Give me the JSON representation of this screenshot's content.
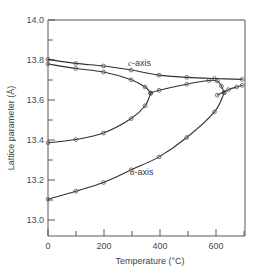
{
  "chart_data": {
    "type": "line",
    "title": "",
    "xlabel": "Temperature  (°C)",
    "ylabel": "Lattice parameter  (Å)",
    "xlim": [
      0,
      710
    ],
    "ylim": [
      12.93,
      14.0
    ],
    "grid": false,
    "legend_position": "inline-annotation",
    "x_ticks_major": [
      0,
      200,
      400,
      600
    ],
    "x_ticklabels": [
      "0",
      "200",
      "400",
      "600"
    ],
    "x_ticks_minor": [
      100,
      300,
      500,
      700
    ],
    "y_ticks_major": [
      14.0,
      13.8,
      13.6,
      13.4,
      13.2,
      13.0
    ],
    "y_ticklabels": [
      "14.0",
      "13.8",
      "13.6",
      "13.4",
      "13.2",
      "13.0"
    ],
    "y_ticks_minor": [
      13.9,
      13.7,
      13.5,
      13.3,
      13.1
    ],
    "annotations": [
      {
        "text": "c-axis",
        "italic_prefix": "c",
        "rest": "-axis",
        "x": 330,
        "y": 13.745
      },
      {
        "text": "a-axis",
        "italic_prefix": "a",
        "rest": "-axis",
        "x": 335,
        "y": 13.265
      }
    ],
    "series": [
      {
        "name": "c-axis upper branch",
        "points": [
          {
            "x": 0,
            "y": 13.805
          },
          {
            "x": 100,
            "y": 13.785
          },
          {
            "x": 200,
            "y": 13.772
          },
          {
            "x": 300,
            "y": 13.752
          },
          {
            "x": 400,
            "y": 13.727
          },
          {
            "x": 500,
            "y": 13.716
          },
          {
            "x": 600,
            "y": 13.71
          },
          {
            "x": 700,
            "y": 13.706
          }
        ]
      },
      {
        "name": "c-axis lower branch (splitting, merges at ~370 C)",
        "points": [
          {
            "x": 0,
            "y": 13.782
          },
          {
            "x": 100,
            "y": 13.76
          },
          {
            "x": 200,
            "y": 13.742
          },
          {
            "x": 300,
            "y": 13.704
          },
          {
            "x": 350,
            "y": 13.668
          },
          {
            "x": 370,
            "y": 13.638
          }
        ]
      },
      {
        "name": "middle branch rising to c-axis cusp at ~370 C",
        "points": [
          {
            "x": 0,
            "y": 13.392
          },
          {
            "x": 100,
            "y": 13.408
          },
          {
            "x": 200,
            "y": 13.44
          },
          {
            "x": 300,
            "y": 13.512
          },
          {
            "x": 350,
            "y": 13.575
          },
          {
            "x": 370,
            "y": 13.638
          }
        ]
      },
      {
        "name": "merged branch from c-axis cusp to a-axis cusp (~610 C)",
        "points": [
          {
            "x": 370,
            "y": 13.638
          },
          {
            "x": 400,
            "y": 13.652
          },
          {
            "x": 500,
            "y": 13.682
          },
          {
            "x": 580,
            "y": 13.7
          },
          {
            "x": 610,
            "y": 13.698
          },
          {
            "x": 625,
            "y": 13.672
          },
          {
            "x": 635,
            "y": 13.64
          }
        ]
      },
      {
        "name": "a-axis branch rising to cusp at ~620 C",
        "points": [
          {
            "x": 0,
            "y": 13.112
          },
          {
            "x": 100,
            "y": 13.152
          },
          {
            "x": 200,
            "y": 13.195
          },
          {
            "x": 300,
            "y": 13.258
          },
          {
            "x": 400,
            "y": 13.322
          },
          {
            "x": 500,
            "y": 13.418
          },
          {
            "x": 600,
            "y": 13.545
          },
          {
            "x": 635,
            "y": 13.64
          }
        ]
      },
      {
        "name": "a-axis upper branch beyond cusp",
        "points": [
          {
            "x": 610,
            "y": 13.628
          },
          {
            "x": 650,
            "y": 13.655
          },
          {
            "x": 680,
            "y": 13.668
          },
          {
            "x": 700,
            "y": 13.676
          }
        ]
      }
    ]
  },
  "axes": {
    "x_title": "Temperature  (°C)",
    "y_title": "Lattice parameter  (Å)",
    "x_tick_0": "0",
    "x_tick_200": "200",
    "x_tick_400": "400",
    "x_tick_600": "600",
    "y_tick_140": "14.0",
    "y_tick_138": "13.8",
    "y_tick_136": "13.6",
    "y_tick_134": "13.4",
    "y_tick_132": "13.2",
    "y_tick_130": "13.0"
  },
  "labels": {
    "c_axis_italic": "c",
    "c_axis_rest": "-axis",
    "a_axis_italic": "a",
    "a_axis_rest": "-axis"
  },
  "colors": {
    "curve": "#2f2f33",
    "axis": "#55565a",
    "text": "#3f3f42",
    "background": "#ffffff"
  }
}
